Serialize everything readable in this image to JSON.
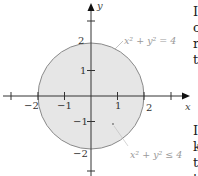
{
  "figure": {
    "axes": {
      "x_label": "x",
      "y_label": "y",
      "x_ticks": [
        {
          "value": -2,
          "label": "−2"
        },
        {
          "value": -1,
          "label": "−1"
        },
        {
          "value": 1,
          "label": "1"
        },
        {
          "value": 2,
          "label": "2"
        }
      ],
      "y_ticks": [
        {
          "value": 2,
          "label": "2"
        },
        {
          "value": 1,
          "label": "1"
        },
        {
          "value": -1,
          "label": "−1"
        },
        {
          "value": -2,
          "label": "−2"
        }
      ]
    },
    "circle": {
      "center": [
        0,
        0
      ],
      "radius": 2,
      "fill": "#e6e6e6",
      "stroke": "#8a8a8a"
    },
    "annotations": {
      "boundary_label": "x² + y² = 4",
      "region_label": "x² + y² ≤ 4"
    }
  },
  "side_text": {
    "top_lines": [
      "I",
      "c",
      "r",
      "t"
    ],
    "bottom_lines": [
      "I",
      "k",
      "t",
      "t"
    ]
  }
}
